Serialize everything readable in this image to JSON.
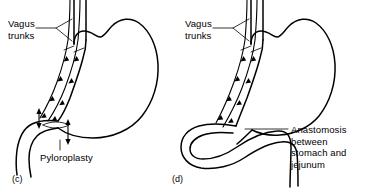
{
  "figure": {
    "type": "medical-illustration",
    "background_color": "#ffffff",
    "line_color": "#000000"
  },
  "panels": [
    {
      "tag": "(c)",
      "name": "truncal-vagotomy-with-pyloroplasty",
      "labels": [
        {
          "name": "vagus-trunks",
          "text": "Vagus\ntrunks",
          "x": 8,
          "y": 18
        },
        {
          "name": "pyloroplasty",
          "text": "Pyloroplasty",
          "x": 40,
          "y": 152
        }
      ],
      "anatomy": [
        "esophagus",
        "stomach",
        "fundus",
        "lesser-curvature",
        "greater-curvature",
        "pylorus",
        "duodenum",
        "anterior-vagus-trunk",
        "posterior-vagus-trunk",
        "pyloroplasty-incision"
      ]
    },
    {
      "tag": "(d)",
      "name": "truncal-vagotomy-with-gastrojejunostomy",
      "labels": [
        {
          "name": "vagus-trunks",
          "text": "Vagus\ntrunks",
          "x": 185,
          "y": 18
        },
        {
          "name": "anastomosis",
          "text": "Anastomosis\nbetween\nstomach and\njejunum",
          "x": 291,
          "y": 124
        }
      ],
      "anatomy": [
        "esophagus",
        "stomach",
        "fundus",
        "lesser-curvature",
        "greater-curvature",
        "jejunal-loop",
        "gastrojejunal-anastomosis",
        "anterior-vagus-trunk",
        "posterior-vagus-trunk"
      ]
    }
  ]
}
